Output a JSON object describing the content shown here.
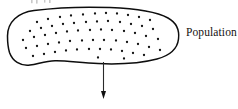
{
  "figure": {
    "caption_label": "Population",
    "background_color": "#ffffff",
    "ink_color": "#0d0d0d",
    "width": 238,
    "height": 109
  },
  "blob": {
    "name": "population-region",
    "stroke_color": "#0d0d0d",
    "fill_color": "#ffffff",
    "stroke_width": 1.5,
    "path": "M 7.5 36 C 7.5 22 18 12.5 34 10.5 C 58 7.5 86 6.6 110 7.6 C 134 8.6 156 11.5 168 18 C 177 23 179.5 31 178.5 39 C 177.5 48 170 55.5 157 59 C 142 63 120 64.5 98 63.6 C 80 62.8 66 60.5 55 60.8 C 45 61 38 64 30 65 C 20 66.2 12.5 61 9.5 52.5 C 8 47.5 7.5 41.5 7.5 36 Z"
  },
  "dots": {
    "name": "sampling-unit-dots",
    "radius": 1.15,
    "color": "#141414",
    "count": 62,
    "points": [
      [
        37,
        22
      ],
      [
        48,
        19
      ],
      [
        60,
        17
      ],
      [
        71,
        15.5
      ],
      [
        83,
        14.5
      ],
      [
        95,
        13.5
      ],
      [
        106,
        13
      ],
      [
        117,
        13.5
      ],
      [
        128,
        15
      ],
      [
        139,
        17
      ],
      [
        150,
        20
      ],
      [
        30,
        31
      ],
      [
        41,
        28
      ],
      [
        52,
        26
      ],
      [
        63,
        24
      ],
      [
        74,
        23
      ],
      [
        86,
        22
      ],
      [
        97,
        21.5
      ],
      [
        108,
        21
      ],
      [
        120,
        22
      ],
      [
        131,
        24
      ],
      [
        142,
        26
      ],
      [
        153,
        29
      ],
      [
        23,
        40
      ],
      [
        34,
        37
      ],
      [
        45,
        35
      ],
      [
        56,
        33
      ],
      [
        67,
        31.5
      ],
      [
        78,
        30.5
      ],
      [
        90,
        30
      ],
      [
        101,
        29.5
      ],
      [
        112,
        30
      ],
      [
        124,
        31
      ],
      [
        135,
        33
      ],
      [
        146,
        36
      ],
      [
        158,
        39
      ],
      [
        26,
        48
      ],
      [
        37,
        46
      ],
      [
        48,
        44
      ],
      [
        59,
        42.5
      ],
      [
        70,
        41
      ],
      [
        82,
        40.5
      ],
      [
        93,
        40
      ],
      [
        104,
        40
      ],
      [
        116,
        40.5
      ],
      [
        127,
        42
      ],
      [
        138,
        44
      ],
      [
        149,
        47
      ],
      [
        160,
        50
      ],
      [
        33,
        56
      ],
      [
        44,
        54
      ],
      [
        55,
        52
      ],
      [
        66,
        50.5
      ],
      [
        77,
        49.5
      ],
      [
        89,
        49
      ],
      [
        100,
        49
      ],
      [
        111,
        49.5
      ],
      [
        122,
        51
      ],
      [
        133,
        53
      ],
      [
        144,
        55
      ],
      [
        98,
        57.5
      ],
      [
        124,
        58.5
      ]
    ]
  },
  "arrow": {
    "name": "sample-draw-arrow",
    "color": "#101010",
    "x": 103.5,
    "y_start": 62,
    "y_end": 99,
    "head_width": 5,
    "head_height": 8
  },
  "cut_text": {
    "name": "clipped-caption-fragment",
    "color": "#c9c9c9",
    "visible": true
  }
}
